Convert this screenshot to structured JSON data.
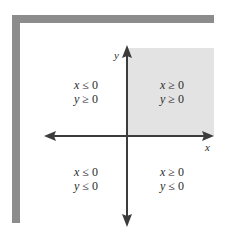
{
  "diagram": {
    "type": "coordinate-plane-quadrants",
    "axes": {
      "x_label": "x",
      "y_label": "y"
    },
    "shaded_quadrant": "first",
    "colors": {
      "frame": "#8c8c8c",
      "shading": "#e3e3e3",
      "axis": "#3c3c3c"
    },
    "quadrants": {
      "top_left": {
        "line1": "x ≤ 0",
        "line2": "y ≥ 0"
      },
      "top_right": {
        "line1": "x ≥ 0",
        "line2": "y ≥ 0"
      },
      "bottom_left": {
        "line1": "x ≤ 0",
        "line2": "y ≤ 0"
      },
      "bottom_right": {
        "line1": "x ≥ 0",
        "line2": "y ≤ 0"
      }
    }
  }
}
